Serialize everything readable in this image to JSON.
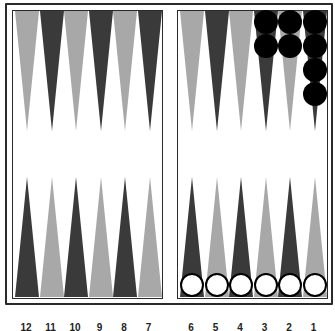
{
  "board": {
    "colors": {
      "dark_point": "#3a3a3a",
      "light_point": "#a8a8a8",
      "frame": "#2a2a2a",
      "black_checker": "#000000",
      "white_checker": "#ffffff"
    },
    "top_left_points": [
      "light",
      "dark",
      "light",
      "dark",
      "light",
      "dark"
    ],
    "top_right_points": [
      "light",
      "dark",
      "light",
      "dark",
      "light",
      "dark"
    ],
    "bottom_left_points": [
      "dark",
      "light",
      "dark",
      "light",
      "dark",
      "light"
    ],
    "bottom_right_points": [
      "dark",
      "light",
      "dark",
      "light",
      "dark",
      "light"
    ],
    "top_right_checkers": [
      {
        "point_index": 3,
        "color": "black",
        "count": 2
      },
      {
        "point_index": 4,
        "color": "black",
        "count": 2
      },
      {
        "point_index": 5,
        "color": "black",
        "count": 4
      }
    ],
    "bottom_right_checkers": [
      {
        "point_index": 0,
        "color": "white",
        "count": 1
      },
      {
        "point_index": 1,
        "color": "white",
        "count": 1
      },
      {
        "point_index": 2,
        "color": "white",
        "count": 1
      },
      {
        "point_index": 3,
        "color": "white",
        "count": 1
      },
      {
        "point_index": 4,
        "color": "white",
        "count": 1
      },
      {
        "point_index": 5,
        "color": "white",
        "count": 1
      }
    ],
    "point_labels_bottom": [
      "12",
      "11",
      "10",
      "9",
      "8",
      "7",
      "6",
      "5",
      "4",
      "3",
      "2",
      "1"
    ]
  }
}
